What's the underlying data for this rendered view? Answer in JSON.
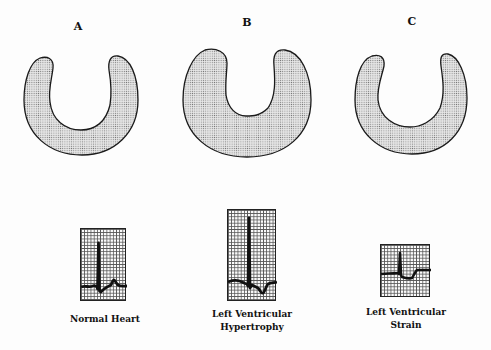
{
  "panels": [
    {
      "letter": "A",
      "caption_lines": [
        "Normal Heart"
      ],
      "condition": "normal"
    },
    {
      "letter": "B",
      "caption_lines": [
        "Left Ventricular",
        "Hypertrophy"
      ],
      "condition": "hypertrophy"
    },
    {
      "letter": "C",
      "caption_lines": [
        "Left Ventricular",
        "Strain"
      ],
      "condition": "strain"
    }
  ],
  "colors": {
    "fill": "#d4d4d4",
    "outline": "#1a1a1a",
    "background": "#fdfdfd"
  }
}
